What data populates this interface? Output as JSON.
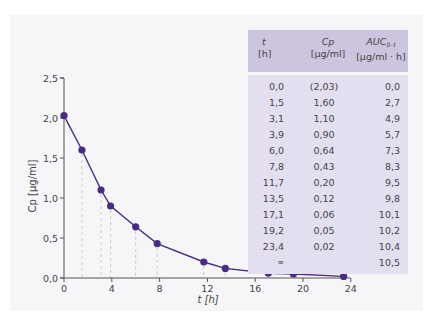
{
  "chart_data": {
    "type": "line",
    "title": "",
    "xlabel": "t [h]",
    "ylabel": "Cp [µg/ml]",
    "xlim": [
      0,
      24
    ],
    "ylim": [
      0,
      2.5
    ],
    "x_ticks": [
      "0",
      "4",
      "8",
      "12",
      "16",
      "20",
      "24"
    ],
    "y_ticks": [
      "0,0",
      "0,5",
      "1,0",
      "1,5",
      "2,0",
      "2,5"
    ],
    "grid": false,
    "drop_lines": true,
    "series": [
      {
        "name": "Cp",
        "x": [
          0.0,
          1.5,
          3.1,
          3.9,
          6.0,
          7.8,
          11.7,
          13.5,
          17.1,
          19.2,
          23.4
        ],
        "values": [
          2.03,
          1.6,
          1.1,
          0.9,
          0.64,
          0.43,
          0.2,
          0.12,
          0.06,
          0.05,
          0.02
        ],
        "color": "#4b2a85"
      }
    ]
  },
  "table": {
    "headers": [
      {
        "var": "t",
        "unit": "[h]"
      },
      {
        "var": "Cp",
        "unit": "[µg/ml]"
      },
      {
        "var": "AUC",
        "sub": "0–t",
        "unit": "[µg/ml · h]"
      }
    ],
    "rows": [
      [
        "0,0",
        "(2,03)",
        "0,0"
      ],
      [
        "1,5",
        "1,60",
        "2,7"
      ],
      [
        "3,1",
        "1,10",
        "4,9"
      ],
      [
        "3,9",
        "0,90",
        "5,7"
      ],
      [
        "6,0",
        "0,64",
        "7,3"
      ],
      [
        "7,8",
        "0,43",
        "8,3"
      ],
      [
        "11,7",
        "0,20",
        "9,5"
      ],
      [
        "13,5",
        "0,12",
        "9,8"
      ],
      [
        "17,1",
        "0,06",
        "10,1"
      ],
      [
        "19,2",
        "0,05",
        "10,2"
      ],
      [
        "23,4",
        "0,02",
        "10,4"
      ],
      [
        "∞",
        "",
        "10,5"
      ]
    ]
  },
  "colors": {
    "panel_bg": "#f6f6f8",
    "table_header_bg": "#cdc5df",
    "table_body_bg": "#e3dff0",
    "series": "#4b2a85",
    "drop_line": "#c8c8cc",
    "axis": "#555555"
  }
}
